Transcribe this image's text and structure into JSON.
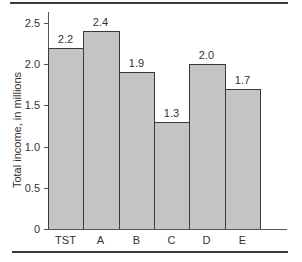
{
  "chart_data": {
    "type": "bar",
    "title": "",
    "xlabel": "",
    "ylabel": "Total income, in millions",
    "categories": [
      "TST",
      "A",
      "B",
      "C",
      "D",
      "E"
    ],
    "values": [
      2.2,
      2.4,
      1.9,
      1.3,
      2.0,
      1.7
    ],
    "value_labels": [
      "2.2",
      "2.4",
      "1.9",
      "1.3",
      "2.0",
      "1.7"
    ],
    "ylim": [
      0,
      2.5
    ],
    "yticks": [
      0,
      0.5,
      1.0,
      1.5,
      2.0,
      2.5
    ],
    "ytick_labels": [
      "0",
      "0.5",
      "1.0",
      "1.5",
      "2.0",
      "2.5"
    ],
    "grid": false,
    "legend": null,
    "bar_color": "#c4c4c4",
    "edge_color": "#3a3a3a"
  }
}
